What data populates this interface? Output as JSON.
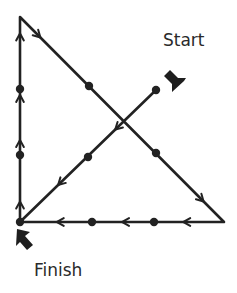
{
  "diagram": {
    "labels": {
      "start": "Start",
      "finish": "Finish"
    },
    "colors": {
      "line": "#222222",
      "dot": "#222222",
      "background": "#ffffff"
    },
    "dots": [
      {
        "x": 20,
        "y": 89
      },
      {
        "x": 89,
        "y": 86
      },
      {
        "x": 156,
        "y": 90
      },
      {
        "x": 20,
        "y": 155
      },
      {
        "x": 88,
        "y": 157
      },
      {
        "x": 156,
        "y": 153
      },
      {
        "x": 20,
        "y": 222
      },
      {
        "x": 92,
        "y": 222
      },
      {
        "x": 154,
        "y": 222
      }
    ],
    "path": [
      {
        "x": 156,
        "y": 90
      },
      {
        "x": 20,
        "y": 222
      },
      {
        "x": 20,
        "y": 17
      },
      {
        "x": 224,
        "y": 222
      },
      {
        "x": 20,
        "y": 222
      }
    ],
    "segments": [
      {
        "name": "diagonal-up-right-to-bottom-left",
        "from": [
          156,
          90
        ],
        "to": [
          20,
          222
        ],
        "direction": "down-left"
      },
      {
        "name": "left-vertical",
        "from": [
          20,
          222
        ],
        "to": [
          20,
          17
        ],
        "direction": "up"
      },
      {
        "name": "diagonal-top-left-to-bottom-right",
        "from": [
          20,
          17
        ],
        "to": [
          224,
          222
        ],
        "direction": "down-right"
      },
      {
        "name": "bottom-horizontal",
        "from": [
          224,
          222
        ],
        "to": [
          20,
          222
        ],
        "direction": "left"
      }
    ]
  }
}
